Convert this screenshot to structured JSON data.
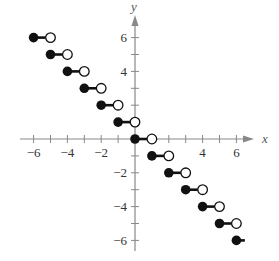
{
  "chart_data": {
    "type": "scatter",
    "subtype": "step-function",
    "title": "",
    "function": "y = -[[x]] (greatest integer)",
    "xlabel": "x",
    "ylabel": "y",
    "xlim": [
      -6.5,
      7
    ],
    "ylim": [
      -6.5,
      7
    ],
    "x_ticks": [
      -6,
      -5,
      -4,
      -3,
      -2,
      -1,
      1,
      2,
      3,
      4,
      5,
      6
    ],
    "y_ticks": [
      -6,
      -5,
      -4,
      -3,
      -2,
      -1,
      1,
      2,
      3,
      4,
      5,
      6
    ],
    "x_tick_labels": [
      "-6",
      "-4",
      "-2",
      "4",
      "6"
    ],
    "y_tick_labels": [
      "6",
      "4",
      "-2",
      "-4",
      "-6"
    ],
    "grid": false,
    "segments": [
      {
        "x_start": -6,
        "x_end": -5,
        "y": 6,
        "start_closed": true,
        "end_closed": false
      },
      {
        "x_start": -5,
        "x_end": -4,
        "y": 5,
        "start_closed": true,
        "end_closed": false
      },
      {
        "x_start": -4,
        "x_end": -3,
        "y": 4,
        "start_closed": true,
        "end_closed": false
      },
      {
        "x_start": -3,
        "x_end": -2,
        "y": 3,
        "start_closed": true,
        "end_closed": false
      },
      {
        "x_start": -2,
        "x_end": -1,
        "y": 2,
        "start_closed": true,
        "end_closed": false
      },
      {
        "x_start": -1,
        "x_end": 0,
        "y": 1,
        "start_closed": true,
        "end_closed": false
      },
      {
        "x_start": 0,
        "x_end": 1,
        "y": 0,
        "start_closed": true,
        "end_closed": false
      },
      {
        "x_start": 1,
        "x_end": 2,
        "y": -1,
        "start_closed": true,
        "end_closed": false
      },
      {
        "x_start": 2,
        "x_end": 3,
        "y": -2,
        "start_closed": true,
        "end_closed": false
      },
      {
        "x_start": 3,
        "x_end": 4,
        "y": -3,
        "start_closed": true,
        "end_closed": false
      },
      {
        "x_start": 4,
        "x_end": 5,
        "y": -4,
        "start_closed": true,
        "end_closed": false
      },
      {
        "x_start": 5,
        "x_end": 6,
        "y": -5,
        "start_closed": true,
        "end_closed": false
      },
      {
        "x_start": 6,
        "x_end": 6.5,
        "y": -6,
        "start_closed": true,
        "end_closed": null
      }
    ]
  },
  "style": {
    "axis_color": "#888888",
    "point_color": "#111111",
    "background": "#ffffff"
  }
}
